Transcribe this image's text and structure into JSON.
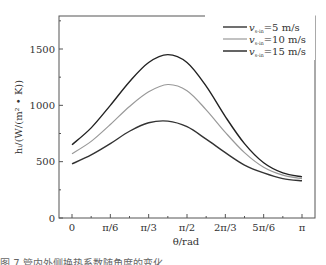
{
  "chart_data": {
    "type": "line",
    "title": "",
    "xlabel": "θ/rad",
    "ylabel": "h_i/(W/(m²·K))",
    "xlim": [
      0,
      3.1416
    ],
    "ylim": [
      0,
      1750
    ],
    "x_ticks": [
      "0",
      "π/6",
      "π/3",
      "π/2",
      "2π/3",
      "5π/6",
      "π"
    ],
    "y_ticks": [
      "0",
      "500",
      "1000",
      "1500"
    ],
    "grid": false,
    "legend_position": "upper right",
    "x": [
      0,
      0.2618,
      0.5236,
      0.7854,
      1.0472,
      1.309,
      1.5708,
      1.8326,
      2.0944,
      2.3562,
      2.618,
      2.8798,
      3.1416
    ],
    "series": [
      {
        "name": "v_s-in=5 m/s",
        "color": "#333333",
        "values": [
          480,
          560,
          660,
          770,
          845,
          860,
          810,
          700,
          580,
          470,
          400,
          350,
          330
        ]
      },
      {
        "name": "v_s-in=10 m/s",
        "color": "#999999",
        "values": [
          570,
          680,
          830,
          990,
          1120,
          1185,
          1130,
          960,
          760,
          580,
          450,
          380,
          350
        ]
      },
      {
        "name": "v_s-in=15 m/s",
        "color": "#222222",
        "values": [
          650,
          800,
          1000,
          1210,
          1380,
          1450,
          1380,
          1170,
          900,
          660,
          490,
          400,
          365
        ]
      }
    ]
  },
  "legend": [
    {
      "label_prefix": "v",
      "label_sub": "s-in",
      "label_suffix": "=5 m/s"
    },
    {
      "label_prefix": "v",
      "label_sub": "s-in",
      "label_suffix": "=10 m/s"
    },
    {
      "label_prefix": "v",
      "label_sub": "s-in",
      "label_suffix": "=15 m/s"
    }
  ],
  "axes": {
    "xlabel": "θ/rad",
    "ylabel": "hᵢ/(W/(m² • K))"
  },
  "caption": "图 7 管内外侧换热系数随角度的变化"
}
